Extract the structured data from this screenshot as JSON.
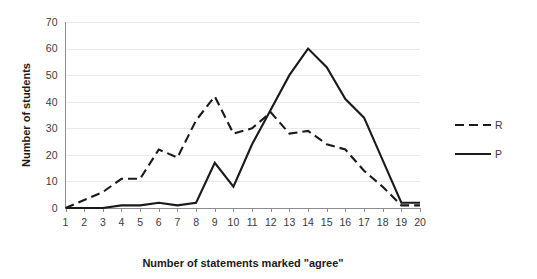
{
  "chart_data": {
    "type": "line",
    "title": "",
    "xlabel": "Number of statements marked \"agree\"",
    "ylabel": "Number of students",
    "x": [
      1,
      2,
      3,
      4,
      5,
      6,
      7,
      8,
      9,
      10,
      11,
      12,
      13,
      14,
      15,
      16,
      17,
      18,
      19,
      20
    ],
    "xlim": [
      1,
      20
    ],
    "ylim": [
      0,
      70
    ],
    "yticks": [
      0,
      10,
      20,
      30,
      40,
      50,
      60,
      70
    ],
    "xticks": [
      "1",
      "2",
      "3",
      "4",
      "5",
      "6",
      "7",
      "8",
      "9",
      "10",
      "11",
      "12",
      "13",
      "14",
      "15",
      "16",
      "17",
      "18",
      "19",
      "20"
    ],
    "grid": "horizontal",
    "legend_position": "right",
    "series": [
      {
        "name": "R",
        "style": "dashed",
        "color": "#1a1a1a",
        "values": [
          0,
          3,
          6,
          11,
          11,
          22,
          19,
          33,
          42,
          28,
          30,
          36,
          28,
          29,
          24,
          22,
          14,
          8,
          1,
          1
        ]
      },
      {
        "name": "P",
        "style": "solid",
        "color": "#1a1a1a",
        "values": [
          0,
          0,
          0,
          1,
          1,
          2,
          1,
          2,
          17,
          8,
          24,
          37,
          50,
          60,
          53,
          41,
          34,
          18,
          2,
          2
        ]
      }
    ]
  },
  "legend": {
    "items": [
      {
        "label": "R",
        "style": "dashed"
      },
      {
        "label": "P",
        "style": "solid"
      }
    ]
  },
  "colors": {
    "series": "#1a1a1a",
    "gridline": "#e9e9e9",
    "axis": "#8d8d8d",
    "background": "#ffffff",
    "text": "#3a3a3a",
    "title_text": "#1a1a1a"
  }
}
